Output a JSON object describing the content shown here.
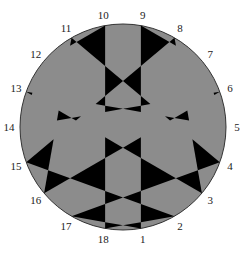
{
  "diagram": {
    "type": "chord-arrangement",
    "center": [
      123,
      127
    ],
    "radius": 103,
    "point_count": 18,
    "first_point_angle_deg": -80,
    "angle_step_deg": 20,
    "label_radius": 114,
    "colors": {
      "fill": "#8c8c8c",
      "triangles": "#000000",
      "outline": "#333333",
      "label": "#222222"
    },
    "points": [
      {
        "id": 1,
        "label": "1"
      },
      {
        "id": 2,
        "label": "2"
      },
      {
        "id": 3,
        "label": "3"
      },
      {
        "id": 4,
        "label": "4"
      },
      {
        "id": 5,
        "label": "5"
      },
      {
        "id": 6,
        "label": "6"
      },
      {
        "id": 7,
        "label": "7"
      },
      {
        "id": 8,
        "label": "8"
      },
      {
        "id": 9,
        "label": "9"
      },
      {
        "id": 10,
        "label": "10"
      },
      {
        "id": 11,
        "label": "11"
      },
      {
        "id": 12,
        "label": "12"
      },
      {
        "id": 13,
        "label": "13"
      },
      {
        "id": 14,
        "label": "14"
      },
      {
        "id": 15,
        "label": "15"
      },
      {
        "id": 16,
        "label": "16"
      },
      {
        "id": 17,
        "label": "17"
      },
      {
        "id": 18,
        "label": "18"
      }
    ],
    "chords": [
      [
        1,
        9
      ],
      [
        10,
        18
      ],
      [
        4,
        11
      ],
      [
        8,
        15
      ],
      [
        11,
        16
      ],
      [
        3,
        8
      ],
      [
        4,
        17
      ],
      [
        2,
        15
      ],
      [
        1,
        17
      ],
      [
        2,
        18
      ],
      [
        5,
        7
      ],
      [
        12,
        14
      ],
      [
        6,
        16
      ],
      [
        3,
        13
      ],
      [
        6,
        14
      ],
      [
        5,
        13
      ],
      [
        10,
        12
      ],
      [
        7,
        9
      ]
    ]
  }
}
